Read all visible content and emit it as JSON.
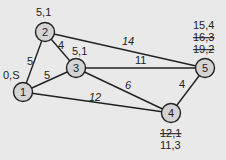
{
  "colors": {
    "background": "#e9e9e9",
    "node_fill": "#d4d4d4",
    "stroke": "#222222"
  },
  "nodes": [
    {
      "id": "1",
      "label": "1",
      "x": 23,
      "y": 92
    },
    {
      "id": "2",
      "label": "2",
      "x": 45,
      "y": 32
    },
    {
      "id": "3",
      "label": "3",
      "x": 76,
      "y": 68
    },
    {
      "id": "4",
      "label": "4",
      "x": 171,
      "y": 113
    },
    {
      "id": "5",
      "label": "5",
      "x": 205,
      "y": 68
    }
  ],
  "edges": [
    {
      "from": "1",
      "to": "2",
      "weight": "5"
    },
    {
      "from": "1",
      "to": "3",
      "weight": "5"
    },
    {
      "from": "1",
      "to": "4",
      "weight": "12"
    },
    {
      "from": "2",
      "to": "3",
      "weight": "4"
    },
    {
      "from": "2",
      "to": "5",
      "weight": "14"
    },
    {
      "from": "3",
      "to": "5",
      "weight": "11"
    },
    {
      "from": "3",
      "to": "4",
      "weight": "6"
    },
    {
      "from": "4",
      "to": "5",
      "weight": "4"
    }
  ],
  "node_labels": {
    "n1": [
      "0,S"
    ],
    "n2": [
      "5,1"
    ],
    "n3": [
      "5,1"
    ],
    "n4": [
      {
        "text": "12,1",
        "struck": true
      },
      {
        "text": "11,3",
        "struck": false
      }
    ],
    "n5": [
      {
        "text": "15,4",
        "struck": false
      },
      {
        "text": "16,3",
        "struck": true
      },
      {
        "text": "19,2",
        "struck": true
      }
    ]
  }
}
